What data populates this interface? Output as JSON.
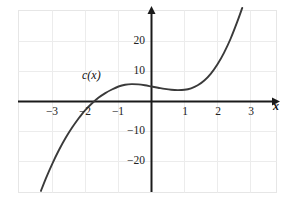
{
  "figure": {
    "background_color": "#ffffff",
    "frame_color": "#e8e8e8",
    "grid_color": "#ebebeb",
    "axis_color": "#1a1a1a",
    "curve_color": "#3a3a3a"
  },
  "chart_data": {
    "type": "line",
    "title": "",
    "xlabel": "x",
    "ylabel": "",
    "xlim": [
      -3.55,
      3.45
    ],
    "ylim": [
      -30.5,
      30.5
    ],
    "grid": true,
    "legend": null,
    "annotations": [
      {
        "text": "c(x)",
        "x": -1.55,
        "y": 9.5
      }
    ],
    "xticks": [
      -3,
      -2,
      -1,
      1,
      2,
      3
    ],
    "xtick_labels": [
      "−3",
      "−2",
      "−1",
      "1",
      "2",
      "3"
    ],
    "yticks": [
      20,
      10,
      -10,
      -20
    ],
    "ytick_labels": [
      "20",
      "10",
      "−10",
      "−20"
    ],
    "series": [
      {
        "name": "c(x)",
        "color": "#3a3a3a",
        "points": [
          [
            -3.35,
            -29.8
          ],
          [
            -3.2,
            -25.6
          ],
          [
            -3.0,
            -20.6
          ],
          [
            -2.8,
            -16.1
          ],
          [
            -2.6,
            -12.1
          ],
          [
            -2.4,
            -8.6
          ],
          [
            -2.2,
            -5.5
          ],
          [
            -2.1,
            -4.1
          ],
          [
            -2.0,
            -2.8
          ],
          [
            -1.8,
            -0.6
          ],
          [
            -1.6,
            1.3
          ],
          [
            -1.4,
            2.8
          ],
          [
            -1.2,
            4.0
          ],
          [
            -1.0,
            5.0
          ],
          [
            -0.8,
            5.6
          ],
          [
            -0.6,
            5.8
          ],
          [
            -0.4,
            5.7
          ],
          [
            -0.2,
            5.4
          ],
          [
            0.0,
            5.0
          ],
          [
            0.2,
            4.6
          ],
          [
            0.4,
            4.2
          ],
          [
            0.6,
            3.9
          ],
          [
            0.8,
            3.8
          ],
          [
            1.0,
            3.9
          ],
          [
            1.2,
            4.4
          ],
          [
            1.4,
            5.4
          ],
          [
            1.6,
            7.0
          ],
          [
            1.8,
            9.3
          ],
          [
            2.0,
            12.4
          ],
          [
            2.2,
            16.3
          ],
          [
            2.4,
            21.0
          ],
          [
            2.6,
            26.6
          ],
          [
            2.75,
            31.2
          ]
        ]
      }
    ]
  },
  "axis_label_x": "x",
  "curve_label": "c(x)"
}
